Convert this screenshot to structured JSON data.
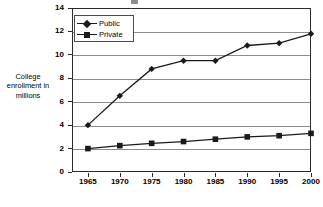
{
  "chart_data": {
    "type": "line",
    "title": "",
    "xlabel": "",
    "ylabel": "College enrollment in millions",
    "ylabel_lines": [
      "College",
      "enrollment in",
      "millions"
    ],
    "categories": [
      "1965",
      "1970",
      "1975",
      "1980",
      "1985",
      "1990",
      "1995",
      "2000"
    ],
    "x": [
      1965,
      1970,
      1975,
      1980,
      1985,
      1990,
      1995,
      2000
    ],
    "series": [
      {
        "name": "Public",
        "marker": "diamond",
        "color": "#1a1a1a",
        "values": [
          4.0,
          6.5,
          8.8,
          9.5,
          9.5,
          10.8,
          11.0,
          11.8
        ]
      },
      {
        "name": "Private",
        "marker": "square",
        "color": "#1a1a1a",
        "values": [
          2.0,
          2.25,
          2.45,
          2.6,
          2.8,
          3.0,
          3.1,
          3.3
        ]
      }
    ],
    "ylim": [
      0,
      14
    ],
    "ytick_values": [
      0,
      2,
      4,
      6,
      8,
      10,
      12,
      14
    ],
    "ytick_labels": [
      "0",
      "2",
      "4",
      "6",
      "8",
      "10",
      "12",
      "14"
    ],
    "xlim": [
      1962.5,
      2000
    ],
    "grid": "horizontal",
    "legend_position": "top-left-inside",
    "background_color": "#ffffff",
    "gridline_color": "#8d8d8d",
    "frame_color": "#2b2b2b"
  },
  "legend": {
    "entries": [
      {
        "label": "Public",
        "marker": "diamond"
      },
      {
        "label": "Private",
        "marker": "square"
      }
    ]
  }
}
